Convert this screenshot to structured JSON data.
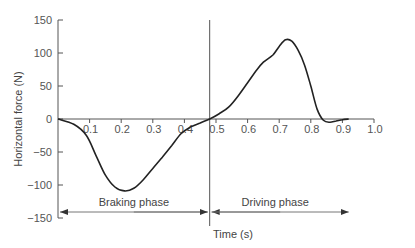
{
  "chart_data": {
    "type": "line",
    "title": "",
    "xlabel": "Time (s)",
    "ylabel": "Horizontal force (N)",
    "xlim": [
      0,
      1.0
    ],
    "ylim": [
      -150,
      150
    ],
    "grid": false,
    "x_ticks": [
      0.1,
      0.2,
      0.3,
      0.4,
      0.5,
      0.6,
      0.7,
      0.8,
      0.9,
      1.0
    ],
    "x_tick_labels": [
      "0.1",
      "0.2",
      "0.3",
      "0.4",
      "0.5",
      "0.6",
      "0.7",
      "0.8",
      "0.9",
      "1.0"
    ],
    "y_ticks": [
      150,
      100,
      50,
      0,
      -50,
      -100,
      -150
    ],
    "y_tick_labels": [
      "150",
      "100",
      "50",
      "0",
      "−50",
      "−100",
      "−150"
    ],
    "series": [
      {
        "name": "Horizontal force",
        "x": [
          0.0,
          0.05,
          0.09,
          0.12,
          0.15,
          0.18,
          0.21,
          0.24,
          0.27,
          0.3,
          0.33,
          0.36,
          0.39,
          0.42,
          0.45,
          0.48,
          0.51,
          0.54,
          0.57,
          0.6,
          0.63,
          0.65,
          0.68,
          0.7,
          0.72,
          0.74,
          0.76,
          0.78,
          0.8,
          0.82,
          0.84,
          0.86,
          0.88,
          0.9,
          0.92
        ],
        "values": [
          0,
          -8,
          -25,
          -55,
          -85,
          -103,
          -109,
          -105,
          -92,
          -75,
          -58,
          -40,
          -22,
          -12,
          -6,
          0,
          8,
          18,
          35,
          55,
          75,
          86,
          97,
          110,
          120,
          118,
          104,
          82,
          50,
          15,
          -2,
          -5,
          -3,
          -1,
          0
        ]
      }
    ],
    "phase_divider_x": 0.48,
    "annotations": [
      {
        "text": "Braking phase",
        "x_start": 0.0,
        "x_end": 0.48,
        "y": -140
      },
      {
        "text": "Driving phase",
        "x_start": 0.48,
        "x_end": 0.92,
        "y": -140
      }
    ]
  }
}
